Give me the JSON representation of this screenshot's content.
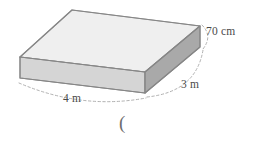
{
  "figure": {
    "name": "cuboid-solid-diagram",
    "shape_type": "rectangular prism",
    "background_color": "#ffffff",
    "faces": {
      "top": {
        "label": "top-face",
        "fill": "#efefef",
        "stroke": "#9a9a9a"
      },
      "front": {
        "label": "front-left-face",
        "fill": "#d5d5d5",
        "stroke": "#8f8f8f"
      },
      "right": {
        "label": "right-side-face",
        "fill": "#a9a9a9",
        "stroke": "#8f8f8f"
      }
    },
    "hidden_edge_style": "dotted",
    "hidden_edge_color": "#b4b4b4",
    "dimension_line_style": "dashed",
    "dimension_line_color": "#a0a0a0"
  },
  "dimensions": {
    "height": {
      "value": "70 cm",
      "numeric": 70,
      "unit": "cm",
      "edge": "vertical-right"
    },
    "depth": {
      "value": "3 m",
      "numeric": 3,
      "unit": "m",
      "edge": "front-right"
    },
    "width": {
      "value": "4 m",
      "numeric": 4,
      "unit": "m",
      "edge": "front-left"
    }
  },
  "annotations": {
    "stray_character": "("
  }
}
